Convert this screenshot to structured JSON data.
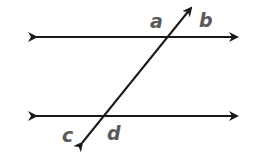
{
  "diagram": {
    "line_color": "#1a1a1a",
    "label_color": "#5a5a5a",
    "parallel_lines": [
      {
        "name": "top-line",
        "y": 37,
        "x1": 33,
        "x2": 240
      },
      {
        "name": "bottom-line",
        "y": 116,
        "x1": 33,
        "x2": 240
      }
    ],
    "transversal": {
      "x1": 80,
      "y1": 146,
      "x2": 193,
      "y2": 5
    },
    "labels": {
      "a": "a",
      "b": "b",
      "c": "c",
      "d": "d"
    }
  }
}
